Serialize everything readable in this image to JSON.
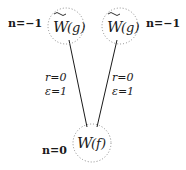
{
  "diagram": {
    "nodes": [
      {
        "id": "left",
        "label_main": "W",
        "label_arg": "(g)",
        "tilde": true,
        "n_label": "n=−1",
        "cx": 66,
        "cy": 26
      },
      {
        "id": "right",
        "label_main": "W",
        "label_arg": "(g)",
        "tilde": true,
        "n_label": "n=−1",
        "cx": 120,
        "cy": 26
      },
      {
        "id": "bottom",
        "label_main": "W",
        "label_arg": "(f)",
        "tilde": false,
        "n_label": "n=0",
        "cx": 92,
        "cy": 143
      }
    ],
    "edges": [
      {
        "from": "left",
        "to": "bottom",
        "r_label": "r=0",
        "eps_label": "ε=1"
      },
      {
        "from": "right",
        "to": "bottom",
        "r_label": "r=0",
        "eps_label": "ε=1"
      }
    ],
    "colors": {
      "ink": "#1a1a1a",
      "dotted": "#8a8a8a"
    }
  }
}
